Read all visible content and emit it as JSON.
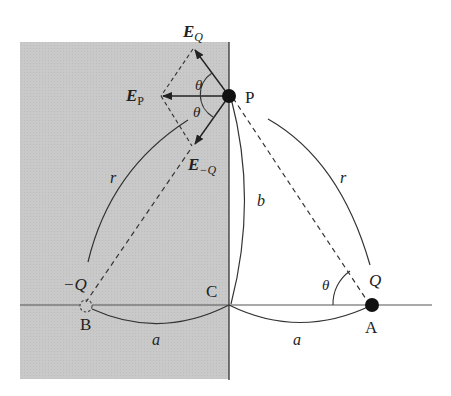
{
  "diagram": {
    "colors": {
      "conductor_fill": "#c8c8c8",
      "line": "#222222",
      "background": "#ffffff"
    },
    "points": {
      "P": "P",
      "A": "A",
      "B": "B",
      "C": "C"
    },
    "charges": {
      "positive": "Q",
      "image": "−Q"
    },
    "vectors": {
      "E_Q_main": "E",
      "E_Q_sub": "Q",
      "E_P_main": "E",
      "E_P_sub": "P",
      "E_negQ_main": "E",
      "E_negQ_sub": "−Q"
    },
    "lengths": {
      "a_left": "a",
      "a_right": "a",
      "b": "b",
      "r_left": "r",
      "r_right": "r"
    },
    "angles": {
      "theta_upper": "θ",
      "theta_lower": "θ",
      "theta_at_A": "θ"
    }
  }
}
